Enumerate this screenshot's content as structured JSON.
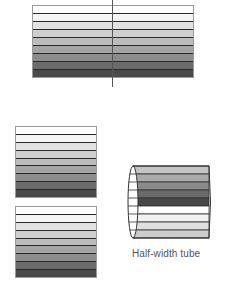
{
  "figure": {
    "stripe_colors": [
      "#ffffff",
      "#f4f4f4",
      "#e2e2e2",
      "#cfcfcf",
      "#bcbcbc",
      "#a4a4a4",
      "#8c8c8c",
      "#6c6c6c",
      "#4a4a4a"
    ],
    "top_stack": {
      "stripes": 9,
      "has_center_line": true
    },
    "middle_stack": {
      "stripes": 9
    },
    "bottom_stack": {
      "stripes": 9
    },
    "tube": {
      "label": "Half-width tube",
      "stripe_colors": [
        "#c4c4c4",
        "#aaaaaa",
        "#8a8a8a",
        "#6a6a6a",
        "#484848",
        "#ffffff",
        "#f2f2f2",
        "#e0e0e0",
        "#cccccc"
      ]
    }
  }
}
